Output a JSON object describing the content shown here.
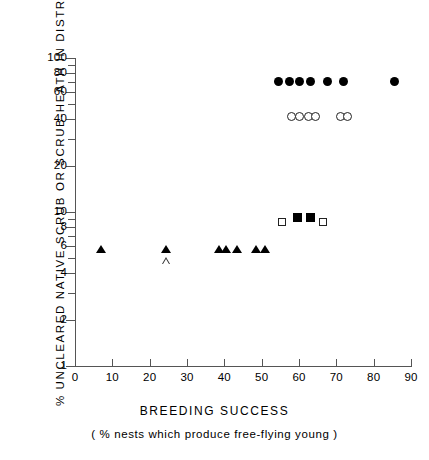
{
  "chart_data": {
    "type": "scatter",
    "title": "",
    "xlabel": "BREEDING  SUCCESS",
    "xsublabel": "( %  nests  which  produce  free-flying  young )",
    "ylabel": "%  UNCLEARED  NATIVE  SCRUB  OR  SCRUB-HEATH  IN  DISTRICT",
    "xlim": [
      0,
      90
    ],
    "ylim": [
      1,
      100
    ],
    "yscale": "log",
    "xscale": "linear",
    "grid": false,
    "legend": "none",
    "xticks": [
      0,
      10,
      20,
      30,
      40,
      50,
      60,
      70,
      80,
      90
    ],
    "xticklabels": [
      "0",
      "10",
      "20",
      "30",
      "40",
      "50",
      "60",
      "70",
      "80",
      "90"
    ],
    "yticks": [
      1,
      2,
      4,
      6,
      8,
      10,
      20,
      40,
      60,
      80,
      100
    ],
    "yticklabels": [
      "1",
      "2",
      "4",
      "6",
      "8",
      "10",
      "20",
      "40",
      "60",
      "80",
      "100"
    ],
    "yminorticks": [
      3,
      5,
      7,
      9,
      30,
      50,
      70,
      90
    ],
    "series": [
      {
        "name": "filled-circle",
        "marker": "circle-filled",
        "points": [
          {
            "x": 54.5,
            "y": 70
          },
          {
            "x": 57.5,
            "y": 70
          },
          {
            "x": 60.0,
            "y": 70
          },
          {
            "x": 63.0,
            "y": 70
          },
          {
            "x": 67.5,
            "y": 70
          },
          {
            "x": 72.0,
            "y": 70
          },
          {
            "x": 85.5,
            "y": 70
          }
        ]
      },
      {
        "name": "open-circle",
        "marker": "circle-open",
        "points": [
          {
            "x": 58.0,
            "y": 42
          },
          {
            "x": 60.0,
            "y": 42
          },
          {
            "x": 62.5,
            "y": 42
          },
          {
            "x": 64.5,
            "y": 42
          },
          {
            "x": 71.0,
            "y": 42
          },
          {
            "x": 73.0,
            "y": 42
          }
        ]
      },
      {
        "name": "filled-square",
        "marker": "square-filled",
        "points": [
          {
            "x": 59.5,
            "y": 9.2
          },
          {
            "x": 63.0,
            "y": 9.2
          }
        ]
      },
      {
        "name": "open-square",
        "marker": "square-open",
        "points": [
          {
            "x": 55.5,
            "y": 8.6
          },
          {
            "x": 66.5,
            "y": 8.6
          }
        ]
      },
      {
        "name": "filled-triangle",
        "marker": "triangle-filled",
        "points": [
          {
            "x": 7.0,
            "y": 5.7
          },
          {
            "x": 24.5,
            "y": 5.7
          },
          {
            "x": 38.5,
            "y": 5.7
          },
          {
            "x": 40.5,
            "y": 5.7
          },
          {
            "x": 43.5,
            "y": 5.7
          },
          {
            "x": 48.5,
            "y": 5.7
          },
          {
            "x": 51.0,
            "y": 5.7
          }
        ]
      },
      {
        "name": "open-triangle",
        "marker": "triangle-open",
        "points": [
          {
            "x": 24.5,
            "y": 4.85
          }
        ]
      }
    ]
  }
}
